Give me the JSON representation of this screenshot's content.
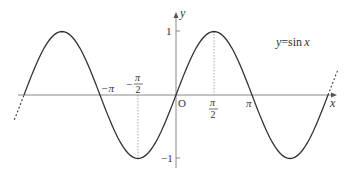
{
  "diagram": {
    "function_label": {
      "lhs": "y",
      "eq": "=",
      "fn": "sin",
      "var": "x"
    },
    "axes": {
      "x_label": "x",
      "y_label": "y",
      "origin_label": "O"
    },
    "ticks": {
      "y_pos": "1",
      "y_neg": "−1",
      "neg_pi": "−π",
      "neg_half_pi_sign": "−",
      "neg_half_pi_num": "π",
      "neg_half_pi_den": "2",
      "half_pi_num": "π",
      "half_pi_den": "2",
      "pi": "π"
    },
    "colors": {
      "curve": "#333333",
      "axis": "#888888",
      "guide": "#999999"
    }
  }
}
